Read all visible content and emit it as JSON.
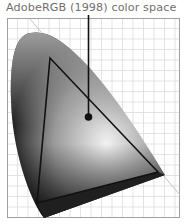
{
  "diagram": {
    "title": "AdobeRGB (1998) color space",
    "type": "chromaticity-diagram",
    "colors": {
      "title_text": "#6f6f6f",
      "grid": "#dcdcdc",
      "frame": "#9a9a9a",
      "triangle": "#111111",
      "pointer": "#111111",
      "gamut_light": "#e8e8e8",
      "gamut_dark": "#1a1a1a"
    },
    "elements": {
      "gamut": "spectral-locus-horseshoe",
      "triangle": "adobe-rgb-gamut-triangle",
      "white_point": "white-point-dot",
      "pointer_line": "callout-line",
      "diagonal_line": "boundary-diagonal"
    }
  }
}
